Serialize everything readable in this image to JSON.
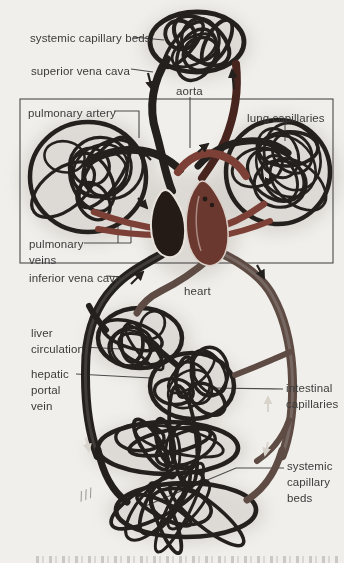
{
  "figure": {
    "labels": {
      "systemic_capillary_beds_top": "systemic capillary beds",
      "superior_vena_cava": "superior vena cava",
      "aorta": "aorta",
      "pulmonary_artery": "pulmonary artery",
      "lung_capillaries": "lung capillaries",
      "pulmonary_veins": "pulmonary\nveins",
      "inferior_vena_cava": "inferior vena cava",
      "heart": "heart",
      "liver_circulation": "liver\ncirculation",
      "hepatic_portal_vein": "hepatic\nportal\nvein",
      "intestinal_capillaries": "intestinal\ncapillaries",
      "systemic_capillary_beds_bottom": "systemic\ncapillary\nbeds"
    }
  },
  "colors": {
    "background": "#f1efeb",
    "ink": "#3b3b3b",
    "line": "#4a4a4a",
    "vessel_dark": "#24201d",
    "vessel_red": "#7c4036",
    "vessel_red_dark": "#47241d",
    "vessel_gray": "#5d4b44",
    "heart_dark": "#241a16",
    "heart_red": "#6b382f",
    "shadow": "#c9c5bf"
  }
}
